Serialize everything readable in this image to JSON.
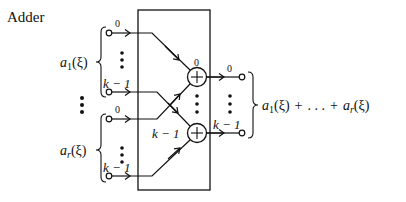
{
  "title": "Adder",
  "inputs": [
    {
      "name": "a_1(ξ)",
      "label_main": "a",
      "label_sub": "1",
      "label_arg": "(ξ)",
      "wires": [
        {
          "index_label": "0"
        },
        {
          "index_label": "k − 1"
        }
      ]
    },
    {
      "name": "a_r(ξ)",
      "label_main": "a",
      "label_sub": "r",
      "label_arg": "(ξ)",
      "wires": [
        {
          "index_label": "0"
        },
        {
          "index_label": "k − 1"
        }
      ]
    }
  ],
  "adders": [
    {
      "index_label": "0",
      "symbol": "+"
    },
    {
      "index_label": "k − 1",
      "symbol": "+"
    }
  ],
  "outputs": [
    {
      "index_label": "0"
    },
    {
      "index_label": "k − 1"
    }
  ],
  "output_sum": {
    "a1_main": "a",
    "a1_sub": "1",
    "a1_arg": "(ξ)",
    "plus1": "+",
    "dots": ". . .",
    "plus2": "+",
    "ar_main": "a",
    "ar_sub": "r",
    "ar_arg": "(ξ)"
  },
  "colors": {
    "ink": "#111111",
    "background": "#ffffff"
  }
}
